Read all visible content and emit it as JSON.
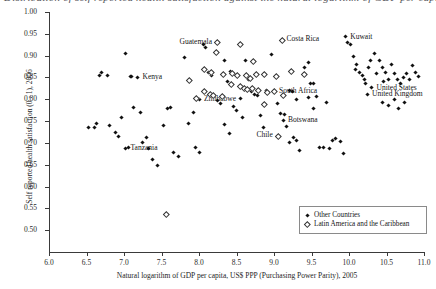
{
  "figure": {
    "title_fragment": "Distribution of self reported health satisfaction against the natural logarithm of GDP per capita"
  },
  "chart_data": {
    "type": "scatter",
    "title": "",
    "xlabel": "Natural logarithm of GDP per capita, US$ PPP (Purchasing Power Parity), 2005",
    "ylabel": "Self reported health satisfaction (0 - 1), 2006",
    "xlim": [
      6.0,
      11.0
    ],
    "ylim": [
      0.45,
      1.0
    ],
    "xticks": [
      "6.0",
      "6.5",
      "7.0",
      "7.5",
      "8.0",
      "8.5",
      "9.0",
      "9.5",
      "10.0",
      "10.5",
      "11.0"
    ],
    "yticks": [
      "0.50",
      "0.55",
      "0.60",
      "0.65",
      "0.70",
      "0.75",
      "0.80",
      "0.85",
      "0.90",
      "0.95",
      "1.00"
    ],
    "grid": false,
    "legend_position": "bottom-right",
    "series": [
      {
        "name": "Other Countries",
        "marker": "filled-diamond",
        "color": "#111111",
        "points": [
          {
            "x": 6.52,
            "y": 0.735
          },
          {
            "x": 6.6,
            "y": 0.735
          },
          {
            "x": 6.63,
            "y": 0.745
          },
          {
            "x": 6.67,
            "y": 0.855
          },
          {
            "x": 6.7,
            "y": 0.862
          },
          {
            "x": 6.78,
            "y": 0.855
          },
          {
            "x": 6.8,
            "y": 0.74
          },
          {
            "x": 6.88,
            "y": 0.725
          },
          {
            "x": 6.93,
            "y": 0.715
          },
          {
            "x": 6.96,
            "y": 0.758
          },
          {
            "x": 7.02,
            "y": 0.905
          },
          {
            "x": 7.08,
            "y": 0.852
          },
          {
            "x": 7.1,
            "y": 0.852
          },
          {
            "x": 7.18,
            "y": 0.851,
            "label": "Kenya",
            "label_side": "right"
          },
          {
            "x": 7.12,
            "y": 0.782
          },
          {
            "x": 7.22,
            "y": 0.77
          },
          {
            "x": 7.25,
            "y": 0.7
          },
          {
            "x": 7.3,
            "y": 0.712
          },
          {
            "x": 7.06,
            "y": 0.69
          },
          {
            "x": 7.02,
            "y": 0.688,
            "label": "Tanzania",
            "label_side": "right"
          },
          {
            "x": 7.32,
            "y": 0.688
          },
          {
            "x": 7.38,
            "y": 0.663
          },
          {
            "x": 7.44,
            "y": 0.648
          },
          {
            "x": 7.52,
            "y": 0.74
          },
          {
            "x": 7.58,
            "y": 0.778
          },
          {
            "x": 7.62,
            "y": 0.782
          },
          {
            "x": 7.66,
            "y": 0.677
          },
          {
            "x": 7.72,
            "y": 0.668
          },
          {
            "x": 7.8,
            "y": 0.895
          },
          {
            "x": 7.86,
            "y": 0.745
          },
          {
            "x": 7.92,
            "y": 0.77
          },
          {
            "x": 7.95,
            "y": 0.69
          },
          {
            "x": 8.0,
            "y": 0.678
          },
          {
            "x": 8.06,
            "y": 0.925
          },
          {
            "x": 8.08,
            "y": 0.918
          },
          {
            "x": 8.12,
            "y": 0.862
          },
          {
            "x": 8.16,
            "y": 0.855
          },
          {
            "x": 8.0,
            "y": 0.8,
            "label": "Zimbabwe",
            "label_side": "right"
          },
          {
            "x": 8.2,
            "y": 0.808
          },
          {
            "x": 8.24,
            "y": 0.798
          },
          {
            "x": 8.28,
            "y": 0.79
          },
          {
            "x": 8.34,
            "y": 0.888
          },
          {
            "x": 8.38,
            "y": 0.84
          },
          {
            "x": 8.42,
            "y": 0.863
          },
          {
            "x": 8.46,
            "y": 0.783
          },
          {
            "x": 8.5,
            "y": 0.774
          },
          {
            "x": 8.55,
            "y": 0.802
          },
          {
            "x": 8.58,
            "y": 0.758
          },
          {
            "x": 8.62,
            "y": 0.89
          },
          {
            "x": 8.66,
            "y": 0.845
          },
          {
            "x": 8.7,
            "y": 0.818
          },
          {
            "x": 8.74,
            "y": 0.812
          },
          {
            "x": 8.78,
            "y": 0.808
          },
          {
            "x": 8.82,
            "y": 0.762
          },
          {
            "x": 8.86,
            "y": 0.735
          },
          {
            "x": 8.9,
            "y": 0.82
          },
          {
            "x": 8.96,
            "y": 0.902
          },
          {
            "x": 9.0,
            "y": 0.818,
            "label": "South Africa",
            "label_side": "right"
          },
          {
            "x": 9.04,
            "y": 0.79
          },
          {
            "x": 9.08,
            "y": 0.768
          },
          {
            "x": 9.12,
            "y": 0.752,
            "label": "Botswana",
            "label_side": "right"
          },
          {
            "x": 9.14,
            "y": 0.766
          },
          {
            "x": 9.16,
            "y": 0.738
          },
          {
            "x": 9.2,
            "y": 0.7
          },
          {
            "x": 9.26,
            "y": 0.712
          },
          {
            "x": 9.3,
            "y": 0.706
          },
          {
            "x": 9.34,
            "y": 0.683
          },
          {
            "x": 9.4,
            "y": 0.872
          },
          {
            "x": 9.46,
            "y": 0.885
          },
          {
            "x": 9.48,
            "y": 0.836
          },
          {
            "x": 9.52,
            "y": 0.836
          },
          {
            "x": 9.56,
            "y": 0.806
          },
          {
            "x": 9.6,
            "y": 0.69
          },
          {
            "x": 9.66,
            "y": 0.69
          },
          {
            "x": 9.7,
            "y": 0.792
          },
          {
            "x": 9.74,
            "y": 0.688
          },
          {
            "x": 9.78,
            "y": 0.706
          },
          {
            "x": 9.82,
            "y": 0.71
          },
          {
            "x": 9.88,
            "y": 0.704
          },
          {
            "x": 9.92,
            "y": 0.676
          },
          {
            "x": 9.95,
            "y": 0.943,
            "label": "Kuwait",
            "label_side": "right"
          },
          {
            "x": 9.98,
            "y": 0.93
          },
          {
            "x": 10.02,
            "y": 0.925
          },
          {
            "x": 10.06,
            "y": 0.898
          },
          {
            "x": 10.1,
            "y": 0.88
          },
          {
            "x": 10.08,
            "y": 0.868
          },
          {
            "x": 10.14,
            "y": 0.862
          },
          {
            "x": 10.18,
            "y": 0.855
          },
          {
            "x": 10.2,
            "y": 0.845
          },
          {
            "x": 10.22,
            "y": 0.836
          },
          {
            "x": 10.26,
            "y": 0.872
          },
          {
            "x": 10.28,
            "y": 0.89
          },
          {
            "x": 10.3,
            "y": 0.826,
            "label": "United States",
            "label_side": "right"
          },
          {
            "x": 10.24,
            "y": 0.812,
            "label": "United Kingdom",
            "label_side": "right"
          },
          {
            "x": 10.34,
            "y": 0.905
          },
          {
            "x": 10.36,
            "y": 0.86
          },
          {
            "x": 10.4,
            "y": 0.888
          },
          {
            "x": 10.44,
            "y": 0.872
          },
          {
            "x": 10.46,
            "y": 0.84
          },
          {
            "x": 10.48,
            "y": 0.862
          },
          {
            "x": 10.52,
            "y": 0.845
          },
          {
            "x": 10.56,
            "y": 0.88
          },
          {
            "x": 10.6,
            "y": 0.86
          },
          {
            "x": 10.64,
            "y": 0.845
          },
          {
            "x": 10.68,
            "y": 0.836
          },
          {
            "x": 10.72,
            "y": 0.85
          },
          {
            "x": 10.76,
            "y": 0.858
          },
          {
            "x": 10.8,
            "y": 0.845
          },
          {
            "x": 10.84,
            "y": 0.878
          },
          {
            "x": 10.88,
            "y": 0.862
          },
          {
            "x": 10.92,
            "y": 0.852
          },
          {
            "x": 10.45,
            "y": 0.792
          },
          {
            "x": 10.52,
            "y": 0.786
          },
          {
            "x": 10.6,
            "y": 0.8
          },
          {
            "x": 10.66,
            "y": 0.778
          },
          {
            "x": 10.74,
            "y": 0.792
          },
          {
            "x": 9.2,
            "y": 0.82
          },
          {
            "x": 9.24,
            "y": 0.818
          },
          {
            "x": 9.3,
            "y": 0.8
          },
          {
            "x": 9.46,
            "y": 0.805
          },
          {
            "x": 9.52,
            "y": 0.78
          },
          {
            "x": 8.34,
            "y": 0.742
          },
          {
            "x": 8.4,
            "y": 0.722
          }
        ]
      },
      {
        "name": "Latin America and the Caribbean",
        "marker": "open-diamond",
        "color": "#ffffff",
        "points": [
          {
            "x": 8.24,
            "y": 0.932,
            "label": "Guatemala",
            "label_side": "left"
          },
          {
            "x": 8.22,
            "y": 0.91
          },
          {
            "x": 8.55,
            "y": 0.928
          },
          {
            "x": 8.72,
            "y": 0.888
          },
          {
            "x": 9.1,
            "y": 0.938,
            "label": "Costa Rica",
            "label_side": "right"
          },
          {
            "x": 8.06,
            "y": 0.87
          },
          {
            "x": 8.16,
            "y": 0.864
          },
          {
            "x": 8.32,
            "y": 0.858
          },
          {
            "x": 8.44,
            "y": 0.862
          },
          {
            "x": 8.5,
            "y": 0.856
          },
          {
            "x": 8.62,
            "y": 0.856
          },
          {
            "x": 8.68,
            "y": 0.85
          },
          {
            "x": 8.76,
            "y": 0.858
          },
          {
            "x": 8.86,
            "y": 0.86
          },
          {
            "x": 9.02,
            "y": 0.855
          },
          {
            "x": 9.22,
            "y": 0.865
          },
          {
            "x": 9.4,
            "y": 0.858
          },
          {
            "x": 7.86,
            "y": 0.845
          },
          {
            "x": 8.42,
            "y": 0.836
          },
          {
            "x": 8.55,
            "y": 0.832
          },
          {
            "x": 8.6,
            "y": 0.828
          },
          {
            "x": 8.64,
            "y": 0.824
          },
          {
            "x": 8.7,
            "y": 0.828
          },
          {
            "x": 8.78,
            "y": 0.822
          },
          {
            "x": 8.9,
            "y": 0.818
          },
          {
            "x": 9.0,
            "y": 0.82
          },
          {
            "x": 9.12,
            "y": 0.812
          },
          {
            "x": 8.06,
            "y": 0.82
          },
          {
            "x": 8.14,
            "y": 0.814
          },
          {
            "x": 8.18,
            "y": 0.812
          },
          {
            "x": 8.3,
            "y": 0.808
          },
          {
            "x": 7.96,
            "y": 0.805
          },
          {
            "x": 8.86,
            "y": 0.79
          },
          {
            "x": 9.05,
            "y": 0.718,
            "label": "Chile",
            "label_side": "left"
          },
          {
            "x": 7.56,
            "y": 0.538
          }
        ]
      }
    ]
  },
  "legend": {
    "items": [
      {
        "label": "Other Countries",
        "marker": "filled-diamond"
      },
      {
        "label": "Latin America and the Caribbean",
        "marker": "open-diamond"
      }
    ]
  }
}
